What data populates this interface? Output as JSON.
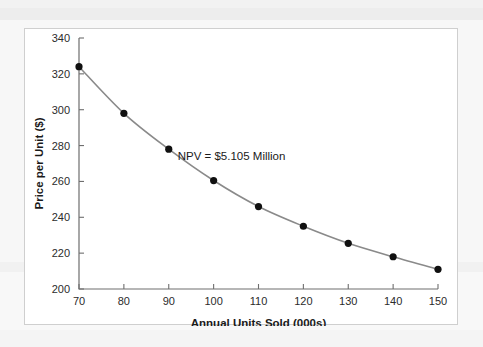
{
  "figure": {
    "background_color": "#ffffff",
    "border_color": "#cfcfcf",
    "page_background_color": "#f4f4f4"
  },
  "chart_data": {
    "type": "line",
    "title": "",
    "subtitle": "",
    "xlabel": "Annual Units Sold (000s)",
    "ylabel": "Price per Unit ($)",
    "x": [
      70,
      80,
      90,
      100,
      110,
      120,
      130,
      140,
      150
    ],
    "values": [
      324,
      298,
      278,
      260.5,
      246,
      235,
      225.5,
      218,
      211
    ],
    "series": [
      {
        "name": "Price per Unit",
        "values": [
          324,
          298,
          278,
          260.5,
          246,
          235,
          225.5,
          218,
          211
        ]
      }
    ],
    "xlim": [
      70,
      150
    ],
    "ylim": [
      200,
      340
    ],
    "xticks": [
      70,
      80,
      90,
      100,
      110,
      120,
      130,
      140,
      150
    ],
    "yticks": [
      200,
      220,
      240,
      260,
      280,
      300,
      320,
      340
    ],
    "xtick_labels": [
      "70",
      "80",
      "90",
      "100",
      "110",
      "120",
      "130",
      "140",
      "150"
    ],
    "ytick_labels": [
      "200",
      "220",
      "240",
      "260",
      "280",
      "300",
      "320",
      "340"
    ],
    "grid": false,
    "legend": false,
    "legend_position": "none",
    "annotations": [
      {
        "text": "NPV = $5.105 Million",
        "x": 104,
        "y": 272
      }
    ],
    "line_color": "#8a8a8a",
    "marker_color": "#101010",
    "axis_color": "#6e6e6e"
  }
}
